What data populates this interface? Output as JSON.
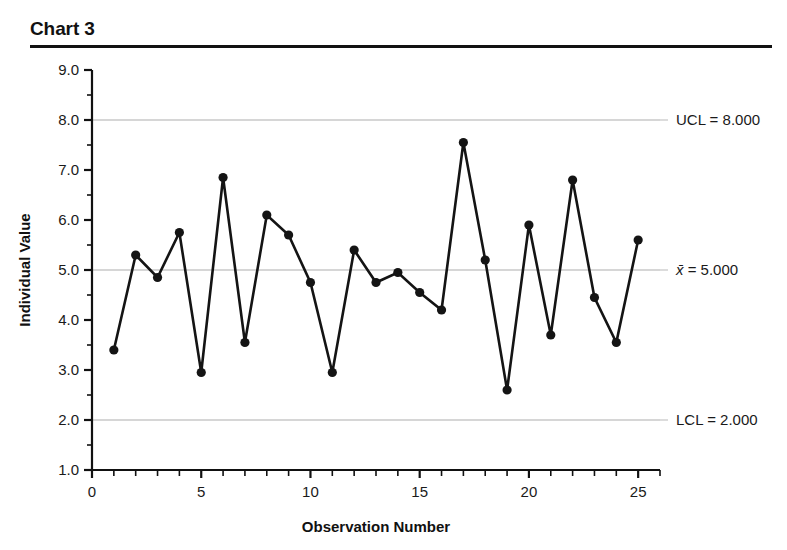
{
  "title": "Chart 3",
  "chart_data": {
    "type": "line",
    "title": "Chart 3",
    "xlabel": "Observation Number",
    "ylabel": "Individual Value",
    "x": [
      1,
      2,
      3,
      4,
      5,
      6,
      7,
      8,
      9,
      10,
      11,
      12,
      13,
      14,
      15,
      16,
      17,
      18,
      19,
      20,
      21,
      22,
      23,
      24,
      25
    ],
    "values": [
      3.4,
      5.3,
      4.85,
      5.75,
      2.95,
      6.85,
      3.55,
      6.1,
      5.7,
      4.75,
      2.95,
      5.4,
      4.75,
      4.95,
      4.55,
      4.2,
      7.55,
      5.2,
      2.6,
      5.9,
      3.7,
      6.8,
      4.45,
      3.55,
      5.6
    ],
    "series": [
      {
        "name": "Individual Value",
        "values": [
          3.4,
          5.3,
          4.85,
          5.75,
          2.95,
          6.85,
          3.55,
          6.1,
          5.7,
          4.75,
          2.95,
          5.4,
          4.75,
          4.95,
          4.55,
          4.2,
          7.55,
          5.2,
          2.6,
          5.9,
          3.7,
          6.8,
          4.45,
          3.55,
          5.6
        ]
      }
    ],
    "xlim": [
      0,
      26
    ],
    "ylim": [
      1.0,
      9.0
    ],
    "xticks": [
      0,
      5,
      10,
      15,
      20,
      25
    ],
    "xtick_labels": [
      "0",
      "5",
      "10",
      "15",
      "20",
      "25"
    ],
    "xtick_minor_step": 1,
    "yticks": [
      1.0,
      2.0,
      3.0,
      4.0,
      5.0,
      6.0,
      7.0,
      8.0,
      9.0
    ],
    "ytick_labels": [
      "1.0",
      "2.0",
      "3.0",
      "4.0",
      "5.0",
      "6.0",
      "7.0",
      "8.0",
      "9.0"
    ],
    "ytick_minor_step": 0.5,
    "grid": true,
    "gridlines": [
      8.0,
      5.0,
      2.0
    ],
    "legend": "none",
    "marker": "circle",
    "line_color": "#141414",
    "marker_color": "#141414",
    "grid_color": "#c9c9c9",
    "control_limits": [
      {
        "name": "UCL",
        "label": "UCL = 8.000",
        "value": 8.0
      },
      {
        "name": "center",
        "label": "x̄ = 5.000",
        "value": 5.0,
        "italic_prefix": "x̄",
        "rest": " = 5.000"
      },
      {
        "name": "LCL",
        "label": "LCL = 2.000",
        "value": 2.0
      }
    ]
  }
}
